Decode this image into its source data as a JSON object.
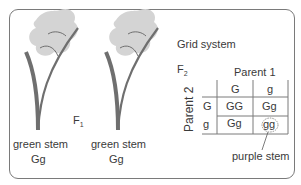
{
  "colors": {
    "stem": "#6f6f6f",
    "leaf_fill": "#d4d4d4",
    "border": "#7a7a7a",
    "text": "#3a3a3a"
  },
  "generation_f1": {
    "label": "F",
    "subscript": "1"
  },
  "plants": [
    {
      "phenotype": "green stem",
      "genotype": "Gg"
    },
    {
      "phenotype": "green stem",
      "genotype": "Gg"
    }
  ],
  "grid": {
    "title": "Grid system",
    "generation": {
      "label": "F",
      "subscript": "2"
    },
    "column_header": "Parent 1",
    "row_header": "Parent 2",
    "column_alleles": [
      "G",
      "g"
    ],
    "row_alleles": [
      "G",
      "g"
    ],
    "cells": [
      [
        "GG",
        "Gg"
      ],
      [
        "Gg",
        "gg"
      ]
    ],
    "highlighted_cell": "gg",
    "annotation": "purple stem"
  }
}
